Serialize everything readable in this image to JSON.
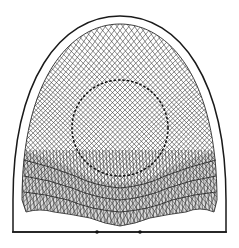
{
  "figure": {
    "type": "mesh-diagram",
    "colors": {
      "background": "#ffffff",
      "outline": "#1a1a1a",
      "mesh": "#3a3a3a",
      "dense_mesh_fill": "#9a9a9a",
      "markers": "#111111"
    },
    "outer_boundary": {
      "apex": [
        120,
        16
      ],
      "base_y": 232,
      "left_x": 12,
      "right_x": 227
    },
    "inner_mesh": {
      "apex": [
        120,
        24
      ],
      "left_x": 22,
      "right_x": 217,
      "bottom_y_range": [
        205,
        225
      ]
    },
    "dotted_circle": {
      "center": [
        120,
        128
      ],
      "radius": 48
    },
    "base_markers": [
      {
        "x": 97,
        "y": 232
      },
      {
        "x": 140,
        "y": 232
      }
    ]
  }
}
